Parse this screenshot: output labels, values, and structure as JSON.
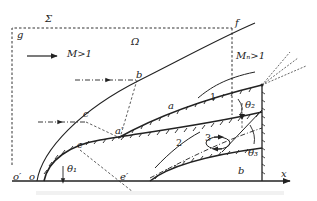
{
  "diagram": {
    "labels": {
      "sigma": "Σ",
      "g": "g",
      "omega": "Ω",
      "mach": "M>1",
      "mach_n": "Mₙ>1",
      "f": "f",
      "b": "b",
      "c": "c",
      "a": "a",
      "a_prime": "a′",
      "e": "e",
      "e_prime": "e′",
      "o": "o",
      "o_prime": "o′",
      "theta1": "θ₁",
      "theta2": "θ₂",
      "theta3": "θ₃",
      "region_b": "b",
      "x": "x",
      "one": "1",
      "two": "2",
      "three": "3"
    },
    "colors": {
      "ink": "#222222",
      "background": "#ffffff"
    }
  }
}
